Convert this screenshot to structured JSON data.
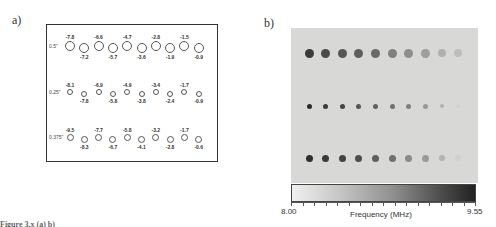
{
  "panel_a": {
    "label": "a)",
    "rows": [
      {
        "label": "0.5\"",
        "size": 10,
        "values": [
          "-7.8",
          "-7.2",
          "-6.6",
          "-5.7",
          "-4.7",
          "-3.6",
          "-2.8",
          "-1.9",
          "-1.5",
          "-0.9"
        ]
      },
      {
        "label": "0.25\"",
        "size": 6,
        "values": [
          "-8.1",
          "-7.8",
          "-6.9",
          "-5.8",
          "-4.9",
          "-3.8",
          "-3.4",
          "-2.4",
          "-1.7",
          "-0.9"
        ]
      },
      {
        "label": "0.375\"",
        "size": 7,
        "values": [
          "-9.5",
          "-8.3",
          "-7.7",
          "-6.7",
          "-5.8",
          "-4.1",
          "-3.2",
          "-2.8",
          "-1.7",
          "-0.6"
        ]
      }
    ]
  },
  "panel_b": {
    "label": "b)",
    "colorbar": {
      "min_label": "8.00",
      "max_label": "9.55",
      "title": "Frequency (MHz)"
    },
    "rows": [
      {
        "size": 9,
        "shades": [
          "#3a3a3a",
          "#4a4a4a",
          "#555",
          "#5e5e5e",
          "#6a6a6a",
          "#808080",
          "#8e8e8e",
          "#9e9e9e",
          "#b0b0b0",
          "#bdbdbd"
        ]
      },
      {
        "size": 5,
        "shades": [
          "#2a2a2a",
          "#3a3a3a",
          "#444",
          "#555",
          "#606060",
          "#707070",
          "#808080",
          "#999",
          "#b0b0b0",
          "#d0d0d0"
        ]
      },
      {
        "size": 7,
        "shades": [
          "#2e2e2e",
          "#3a3a3a",
          "#444",
          "#4e4e4e",
          "#5e5e5e",
          "#707070",
          "#8a8a8a",
          "#9a9a9a",
          "#b4b4b4",
          "#d0d0d0"
        ]
      }
    ]
  },
  "caption": "Figure 3.x    (a)                          b)"
}
